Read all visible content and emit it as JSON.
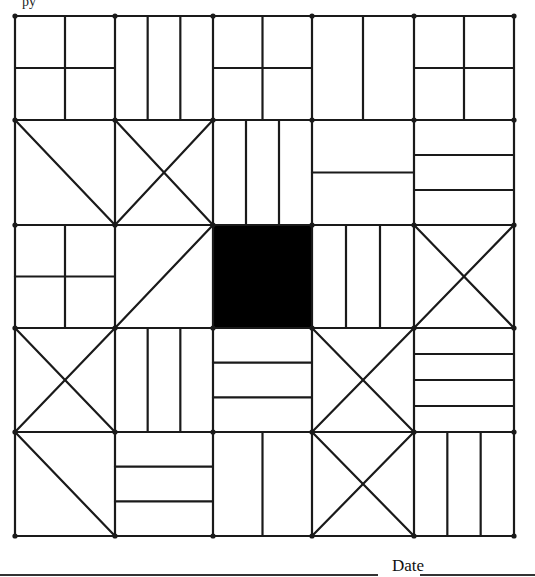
{
  "header": {
    "fragment": "py"
  },
  "footer": {
    "date_label": "Date"
  },
  "grid": {
    "rows": 5,
    "cols": 5,
    "x_lines": [
      15,
      115,
      213,
      312,
      414,
      514
    ],
    "y_lines": [
      16,
      120,
      225,
      328,
      432,
      536
    ],
    "stroke_color": "#1a1a1a",
    "fill_color": "#000000",
    "tiles": [
      [
        "quad",
        "vertical-3",
        "quad",
        "vertical-2",
        "quad"
      ],
      [
        "diag-down",
        "x",
        "vertical-3",
        "horizontal-2",
        "horizontal-3"
      ],
      [
        "quad",
        "diag-up",
        "solid",
        "vertical-3",
        "x"
      ],
      [
        "x",
        "vertical-3",
        "horizontal-3",
        "x",
        "horizontal-4"
      ],
      [
        "diag-down",
        "horizontal-3",
        "vertical-2",
        "x",
        "vertical-3"
      ]
    ]
  }
}
